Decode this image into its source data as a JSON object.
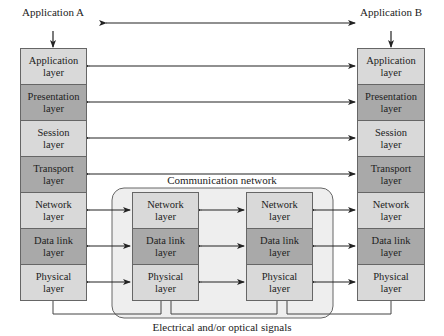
{
  "top": {
    "left_app": "Application A",
    "right_app": "Application B"
  },
  "stack_layers": [
    {
      "label": "Application\nlayer",
      "shade": "light"
    },
    {
      "label": "Presentation\nlayer",
      "shade": "dark"
    },
    {
      "label": "Session\nlayer",
      "shade": "light"
    },
    {
      "label": "Transport\nlayer",
      "shade": "dark"
    },
    {
      "label": "Network\nlayer",
      "shade": "light"
    },
    {
      "label": "Data link\nlayer",
      "shade": "dark"
    },
    {
      "label": "Physical\nlayer",
      "shade": "light"
    }
  ],
  "network": {
    "title": "Communication network",
    "node_layers": [
      {
        "label": "Network\nlayer",
        "shade": "light"
      },
      {
        "label": "Data link\nlayer",
        "shade": "dark"
      },
      {
        "label": "Physical\nlayer",
        "shade": "light"
      }
    ]
  },
  "bottom_caption": "Electrical and/or optical signals",
  "colors": {
    "light": "#d9d9d9",
    "dark": "#a9a9a9",
    "network_bg": "#eeeeee",
    "line": "#222222"
  }
}
